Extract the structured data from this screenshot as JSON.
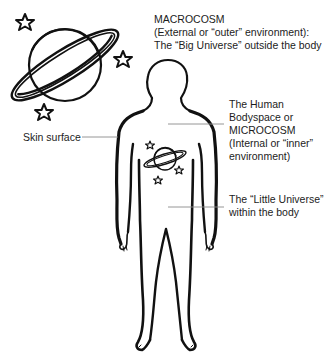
{
  "diagram": {
    "type": "labeled-illustration",
    "labels": {
      "macrocosm": {
        "lines": [
          "MACROCOSM",
          "(External or “outer” environment):",
          "The “Big Universe” outside the body"
        ]
      },
      "skin": {
        "text": "Skin surface"
      },
      "microcosm": {
        "lines": [
          "The Human",
          "Bodyspace or",
          "MICROCOSM",
          "(Internal or “inner”",
          "environment)"
        ]
      },
      "little_universe": {
        "lines": [
          "The “Little Universe”",
          "within the body"
        ]
      }
    },
    "figures": {
      "big_planet": "ringed-planet-icon",
      "small_planet": "ringed-planet-icon",
      "stars": "star-icon",
      "body": "human-silhouette"
    },
    "colors": {
      "stroke": "#111111",
      "leader": "#8a8a8a",
      "text": "#1c1c1c"
    }
  }
}
